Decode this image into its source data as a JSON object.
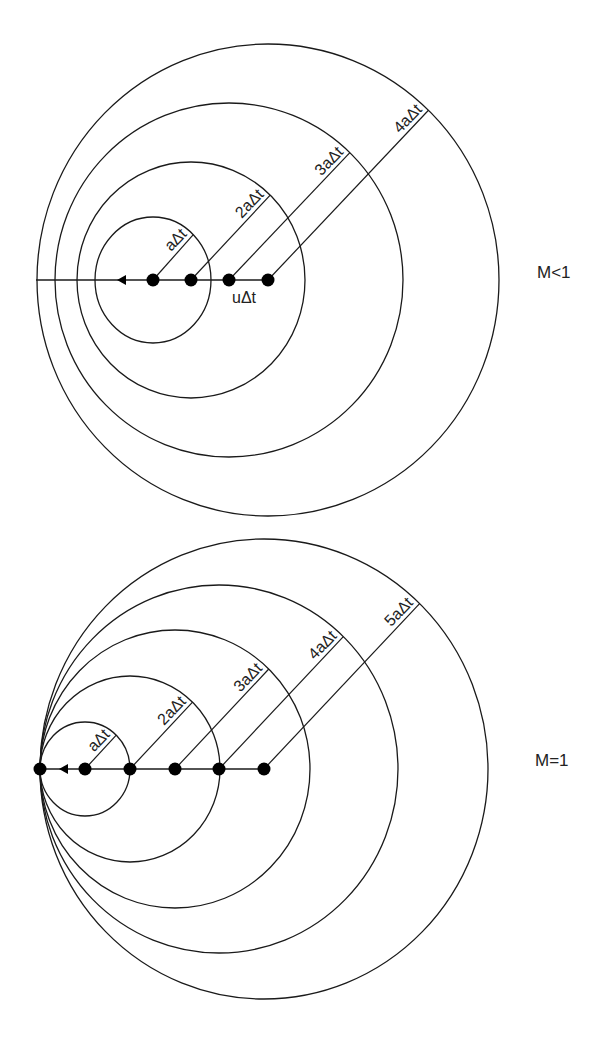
{
  "diagrams": [
    {
      "id": "subsonic",
      "case_label": "M<1",
      "case_label_pos": [
        537,
        278
      ],
      "axis_y": 280,
      "line_start_x": 36,
      "arrow_tip_x": 117,
      "sources": [
        {
          "cx": 268,
          "rx": 231,
          "ry": 236,
          "label": "4aΔt"
        },
        {
          "cx": 229,
          "rx": 174,
          "ry": 177,
          "label": "3aΔt"
        },
        {
          "cx": 191,
          "rx": 114,
          "ry": 118,
          "label": "2aΔt"
        },
        {
          "cx": 153,
          "rx": 58,
          "ry": 63,
          "label": "aΔt"
        }
      ],
      "annotation": {
        "text": "uΔt",
        "x": 232,
        "y": 303
      }
    },
    {
      "id": "sonic",
      "case_label": "M=1",
      "case_label_pos": [
        535,
        766
      ],
      "axis_y": 769,
      "line_start_x": 40,
      "arrow_tip_x": 59,
      "current_dot_x": 40,
      "sources": [
        {
          "cx": 264,
          "rx": 224,
          "ry": 230,
          "label": "5aΔt"
        },
        {
          "cx": 219,
          "rx": 179,
          "ry": 184,
          "label": "4aΔt"
        },
        {
          "cx": 175,
          "rx": 135,
          "ry": 139,
          "label": "3aΔt"
        },
        {
          "cx": 130,
          "rx": 90,
          "ry": 93,
          "label": "2aΔt"
        },
        {
          "cx": 85,
          "rx": 45,
          "ry": 47,
          "label": "aΔt"
        }
      ]
    }
  ],
  "radius_angle_deg": 46,
  "colors": {
    "stroke": "#1a1a1a",
    "dot": "#000000",
    "text": "#222222",
    "background": "#ffffff"
  }
}
